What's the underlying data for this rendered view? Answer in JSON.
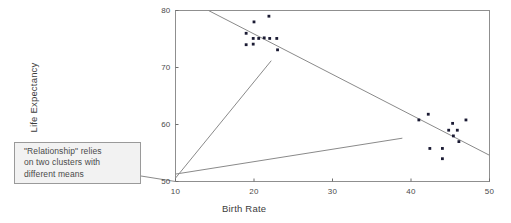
{
  "callout": {
    "lines": [
      "\"Relationship\" relies",
      "on two clusters with",
      "different means"
    ],
    "box_color": "#f2f2f2",
    "border_color": "#9a9a9a",
    "text_color": "#4a4a4a"
  },
  "chart_data": {
    "type": "scatter",
    "title": "",
    "xlabel": "Birth Rate",
    "ylabel": "Life Expectancy",
    "xlim": [
      10,
      50
    ],
    "ylim": [
      50,
      80
    ],
    "xticks": [
      10,
      20,
      30,
      40,
      50
    ],
    "yticks": [
      50,
      60,
      70,
      80
    ],
    "xtick_labels": [
      "10",
      "20",
      "30",
      "40",
      "50"
    ],
    "ytick_labels": [
      "50",
      "60",
      "70",
      "80"
    ],
    "grid": false,
    "legend": "none",
    "frame": "full-box",
    "marker_color": "#1a1a33",
    "line_color": "#8a8a8a",
    "points": [
      {
        "x": 19.0,
        "y": 76.0
      },
      {
        "x": 19.0,
        "y": 74.0
      },
      {
        "x": 19.9,
        "y": 75.1
      },
      {
        "x": 19.9,
        "y": 74.1
      },
      {
        "x": 20.0,
        "y": 78.0
      },
      {
        "x": 20.6,
        "y": 75.1
      },
      {
        "x": 21.3,
        "y": 75.2
      },
      {
        "x": 21.9,
        "y": 79.0
      },
      {
        "x": 22.0,
        "y": 75.1
      },
      {
        "x": 22.9,
        "y": 75.1
      },
      {
        "x": 23.0,
        "y": 73.1
      },
      {
        "x": 41.0,
        "y": 60.8
      },
      {
        "x": 42.2,
        "y": 61.8
      },
      {
        "x": 42.4,
        "y": 55.8
      },
      {
        "x": 44.0,
        "y": 55.8
      },
      {
        "x": 44.0,
        "y": 54.0
      },
      {
        "x": 44.8,
        "y": 59.0
      },
      {
        "x": 45.3,
        "y": 60.2
      },
      {
        "x": 45.4,
        "y": 58.0
      },
      {
        "x": 45.9,
        "y": 59.0
      },
      {
        "x": 46.1,
        "y": 57.0
      },
      {
        "x": 47.0,
        "y": 60.8
      }
    ],
    "lines": [
      {
        "name": "overall-regression-line",
        "x0": 14.2,
        "y0": 80.0,
        "x1": 50.0,
        "y1": 54.6
      },
      {
        "name": "cluster-slope-line-steep",
        "x0": 10.0,
        "y0": 50.6,
        "x1": 22.2,
        "y1": 71.2
      },
      {
        "name": "cluster-slope-line-shallow",
        "x0": 10.0,
        "y0": 51.3,
        "x1": 38.9,
        "y1": 57.6
      }
    ]
  }
}
